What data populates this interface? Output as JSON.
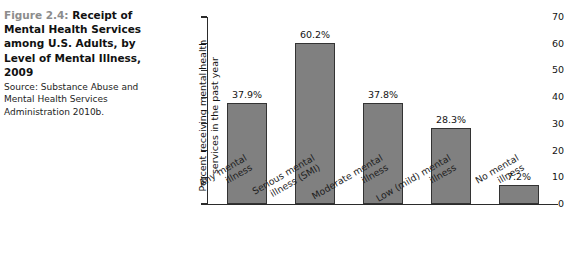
{
  "caption": {
    "figure_number": "Figure 2.4:",
    "title": "Receipt of Mental Health Services among U.S. Adults, by Level of Mental Illness, 2009",
    "source": "Source: Substance Abuse and Mental Health Services Administration 2010b."
  },
  "colors": {
    "bar_fill": "#808080",
    "bar_stroke": "#333333",
    "axis": "#2b2b2b",
    "figure_number": "#8c8c8c",
    "text": "#131313",
    "background": "#ffffff"
  },
  "chart_data": {
    "type": "bar",
    "title": "Receipt of Mental Health Services among U.S. Adults, by Level of Mental Illness, 2009",
    "xlabel": "",
    "ylabel": "Percent receiving mental health\nservices in the past year",
    "categories": [
      "Any mental\nillness",
      "Serious mental\nillness (SMI)",
      "Moderate mental\nillness",
      "Low (mild) mental\nillness",
      "No mental\nillness"
    ],
    "values": [
      37.9,
      60.2,
      37.8,
      28.3,
      7.2
    ],
    "data_labels": [
      "37.9%",
      "60.2%",
      "37.8%",
      "28.3%",
      "7.2%"
    ],
    "ylim": [
      0,
      70
    ],
    "yticks": [
      0,
      10,
      20,
      30,
      40,
      50,
      60,
      70
    ],
    "ytick_labels": [
      "0",
      "10",
      "20",
      "30",
      "40",
      "50",
      "60",
      "70"
    ],
    "grid": false,
    "legend": null
  }
}
